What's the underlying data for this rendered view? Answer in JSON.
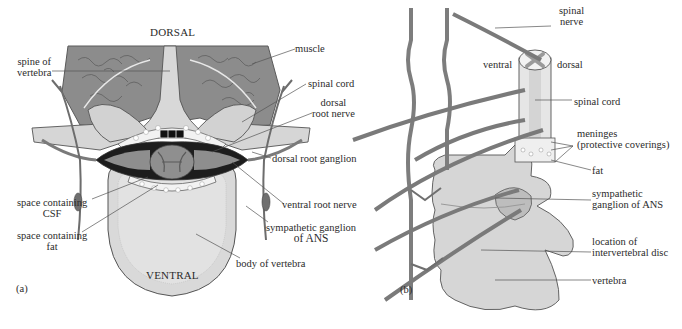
{
  "figure": {
    "panels": [
      {
        "id": "a",
        "tag": "(a)",
        "orientation_top": "DORSAL",
        "orientation_bottom": "VENTRAL",
        "labels": {
          "spine_of_vertebra": [
            "spine of",
            "vertebra"
          ],
          "muscle": "muscle",
          "spinal_cord": "spinal cord",
          "dorsal_root_nerve": [
            "dorsal",
            "root nerve"
          ],
          "dorsal_root_ganglion": "dorsal root ganglion",
          "ventral_root_nerve": "ventral root nerve",
          "sympathetic_ganglion": [
            "sympathetic ganglion",
            "of ANS"
          ],
          "body_of_vertebra": "body of vertebra",
          "space_csf": [
            "space containing",
            "CSF"
          ],
          "space_fat": [
            "space containing",
            "fat"
          ]
        }
      },
      {
        "id": "b",
        "tag": "(b)",
        "labels": {
          "spinal_nerve": [
            "spinal",
            "nerve"
          ],
          "ventral": "ventral",
          "dorsal": "dorsal",
          "spinal_cord": "spinal cord",
          "meninges": [
            "meninges",
            "(protective coverings)"
          ],
          "fat": "fat",
          "sympathetic_ganglion": [
            "sympathetic",
            "ganglion of ANS"
          ],
          "intervertebral_disc": [
            "location of",
            "intervertebral disc"
          ],
          "vertebra": "vertebra"
        }
      }
    ],
    "colors": {
      "muscle": "#8a8a8a",
      "bone": "#d4d4d4",
      "nerve": "#7d7d7d",
      "cord": "#9a9a9a",
      "outline": "#4a4a4a",
      "leader": "#555555"
    }
  }
}
